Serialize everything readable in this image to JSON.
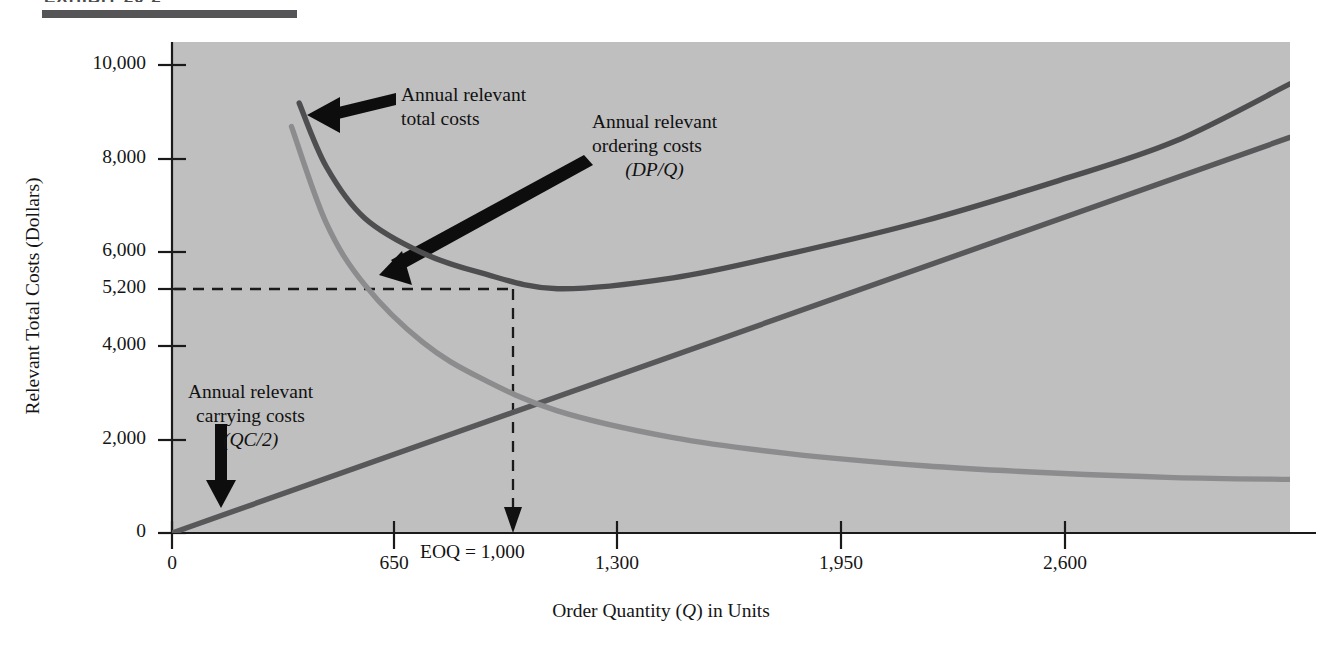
{
  "figure": {
    "header_rule": true,
    "header_ghost_text": "EXHIBIT 20-2"
  },
  "chart_data": {
    "type": "line",
    "title": "",
    "subtitle": "",
    "xlabel_parts": [
      "Order Quantity (",
      "Q",
      ") in Units"
    ],
    "xlabel": "Order Quantity (Q) in Units",
    "ylabel": "Relevant Total Costs (Dollars)",
    "xlim": [
      0,
      2900
    ],
    "ylim": [
      0,
      10450
    ],
    "xticks": [
      0,
      650,
      1300,
      1950,
      2600
    ],
    "xtick_labels": [
      "0",
      "650",
      "1,300",
      "1,950",
      "2,600"
    ],
    "yticks": [
      0,
      2000,
      4000,
      5200,
      6000,
      8000,
      10000
    ],
    "ytick_labels": [
      "0",
      "2,000",
      "4,000",
      "5,200",
      "6,000",
      "8,000",
      "10,000"
    ],
    "grid": false,
    "legend": "none",
    "plot_background": "#bfbfbf",
    "series": [
      {
        "name": "Annual relevant carrying costs",
        "formula": "QC/2",
        "type": "line-linear",
        "color": "#58585a",
        "points": [
          [
            0,
            0
          ],
          [
            650,
            1890
          ],
          [
            1000,
            2600
          ],
          [
            1300,
            3400
          ],
          [
            1950,
            5300
          ],
          [
            2600,
            7170
          ],
          [
            2900,
            8420
          ]
        ]
      },
      {
        "name": "Annual relevant ordering costs",
        "formula": "DP/Q",
        "type": "line-hyperbolic",
        "color": "#8c8c8e",
        "points": [
          [
            310,
            8650
          ],
          [
            400,
            6600
          ],
          [
            500,
            5280
          ],
          [
            650,
            4060
          ],
          [
            800,
            3300
          ],
          [
            1000,
            2600
          ],
          [
            1300,
            2030
          ],
          [
            1600,
            1690
          ],
          [
            1950,
            1430
          ],
          [
            2300,
            1270
          ],
          [
            2600,
            1180
          ],
          [
            2900,
            1140
          ]
        ]
      },
      {
        "name": "Annual relevant total costs",
        "formula": "DP/Q + QC/2",
        "type": "line-u-shaped",
        "color": "#4e4e50",
        "points": [
          [
            330,
            9150
          ],
          [
            400,
            7800
          ],
          [
            500,
            6700
          ],
          [
            650,
            5960
          ],
          [
            800,
            5540
          ],
          [
            1000,
            5200
          ],
          [
            1300,
            5430
          ],
          [
            1600,
            5940
          ],
          [
            1950,
            6640
          ],
          [
            2300,
            7500
          ],
          [
            2600,
            8330
          ],
          [
            2900,
            9560
          ]
        ]
      }
    ],
    "annotations": [
      {
        "id": "total-costs",
        "lines": [
          "Annual relevant",
          "total costs"
        ],
        "align": "left",
        "arrow": "left"
      },
      {
        "id": "ordering-costs",
        "lines": [
          "Annual relevant",
          "ordering costs",
          "(DP/Q)"
        ],
        "italic_line": 2,
        "align": "left",
        "arrow": "down-left-diagonal"
      },
      {
        "id": "carrying-costs",
        "lines": [
          "Annual relevant",
          "carrying costs",
          "(QC/2)"
        ],
        "italic_line": 2,
        "align": "center",
        "arrow": "down"
      }
    ],
    "markers": {
      "eoq_label": "EOQ = 1,000",
      "eoq_x": 1000,
      "eoq_y": 5200,
      "dashed_horizontal_value": "5,200",
      "dashed_vertical_value": "1,000"
    }
  }
}
